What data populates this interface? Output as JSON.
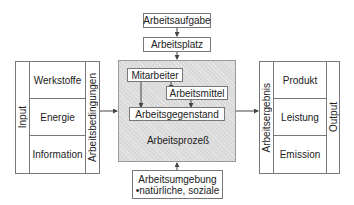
{
  "top": {
    "task": "Arbeitsaufgabe",
    "workplace": "Arbeitsplatz"
  },
  "process": {
    "label": "Arbeitsprozeß",
    "employee": "Mitarbeiter",
    "tools": "Arbeitsmittel",
    "object": "Arbeitsgegenstand"
  },
  "input": {
    "label": "Input",
    "conditions_label": "Arbeitsbedingungen",
    "items": [
      "Werkstoffe",
      "Energie",
      "Information"
    ]
  },
  "output": {
    "label": "Output",
    "result_label": "Arbeitsergebnis",
    "items": [
      "Produkt",
      "Leistung",
      "Emission"
    ]
  },
  "environment": {
    "title": "Arbeitsumgebung",
    "detail": "•natürliche, soziale"
  },
  "colors": {
    "process_fill": "#d9d9d9",
    "border": "#777777",
    "arrow": "#444444"
  }
}
